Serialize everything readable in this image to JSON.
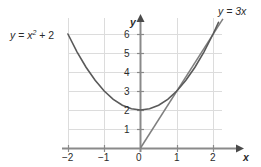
{
  "chart_data": {
    "type": "line",
    "title": "",
    "xlabel": "x",
    "ylabel": "y",
    "xlim": [
      -2.0,
      2.3
    ],
    "ylim": [
      0,
      6.85
    ],
    "grid": true,
    "legend": "inline-labels",
    "xticks": [
      -2,
      -1,
      0,
      1,
      2
    ],
    "xtick_labels": [
      "−2",
      "−1",
      "0",
      "1",
      "2"
    ],
    "yticks": [
      1,
      2,
      3,
      4,
      5,
      6
    ],
    "ytick_labels": [
      "1",
      "2",
      "3",
      "4",
      "5",
      "6"
    ],
    "series": [
      {
        "name": "y = x² + 2",
        "equation": "y = x^2 + 2",
        "color": "#5a5a5a",
        "x": [
          -2.0,
          -1.75,
          -1.5,
          -1.25,
          -1.0,
          -0.75,
          -0.5,
          -0.25,
          0.0,
          0.25,
          0.5,
          0.75,
          1.0,
          1.25,
          1.5,
          1.75,
          2.0,
          2.15
        ],
        "values": [
          6.0,
          5.0625,
          4.25,
          3.5625,
          3.0,
          2.5625,
          2.25,
          2.0625,
          2.0,
          2.0625,
          2.25,
          2.5625,
          3.0,
          3.5625,
          4.25,
          5.0625,
          6.0,
          6.62
        ]
      },
      {
        "name": "y = 3x",
        "equation": "y = 3x",
        "color": "#7a7a7a",
        "x": [
          0.0,
          2.27
        ],
        "values": [
          0.0,
          6.8
        ]
      }
    ],
    "annotations": [
      {
        "text_parts": {
          "lhs": "y",
          "eq": "=",
          "base": "x",
          "exp": "2",
          "plus": "+ 2"
        },
        "full": "y = x² + 2",
        "at_x": -2.0,
        "at_y": 6.0
      },
      {
        "full": "y = 3x",
        "at_x": 2.27,
        "at_y": 6.8
      }
    ],
    "tangent_point": {
      "x": 1,
      "y": 3
    }
  },
  "labels": {
    "x_axis": "x",
    "y_axis": "y",
    "parabola": {
      "lhs": "y",
      "eq": "=",
      "base": "x",
      "exp": "2",
      "tail": "+ 2"
    },
    "line": "y = 3x"
  },
  "ticks": {
    "x": [
      "−2",
      "−1",
      "0",
      "1",
      "2"
    ],
    "y": [
      "6",
      "5",
      "4",
      "3",
      "2",
      "1"
    ]
  },
  "colors": {
    "grid": "#dcdcdc",
    "axis": "#8a8a8a",
    "parabola": "#5a5a5a",
    "line": "#7f7f7f",
    "text": "#2b2b2b",
    "background": "#ffffff"
  }
}
